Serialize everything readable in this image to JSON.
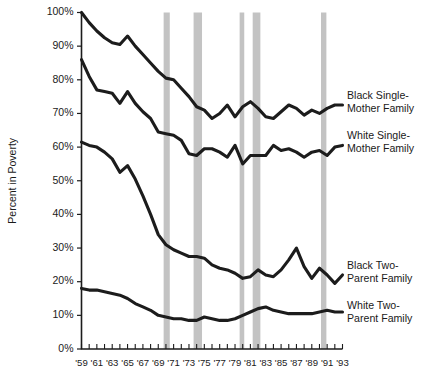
{
  "chart_data": {
    "type": "line",
    "title": "",
    "xlabel": "",
    "ylabel": "Percent in Poverty",
    "ylim": [
      0,
      100
    ],
    "xlim": [
      1959,
      1993
    ],
    "grid": false,
    "legend_position": "right-inline",
    "y_ticks": [
      "0%",
      "10%",
      "20%",
      "30%",
      "40%",
      "50%",
      "60%",
      "70%",
      "80%",
      "90%",
      "100%"
    ],
    "y_tick_values": [
      0,
      10,
      20,
      30,
      40,
      50,
      60,
      70,
      80,
      90,
      100
    ],
    "x_ticks": [
      "'59",
      "'61",
      "'63",
      "'65",
      "'67",
      "'69",
      "'71",
      "'73",
      "'75",
      "'77",
      "'79",
      "'81",
      "'83",
      "'85",
      "'87",
      "'89",
      "'91",
      "'93"
    ],
    "x_tick_values": [
      1959,
      1961,
      1963,
      1965,
      1967,
      1969,
      1971,
      1973,
      1975,
      1977,
      1979,
      1981,
      1983,
      1985,
      1987,
      1989,
      1991,
      1993
    ],
    "x": [
      1959,
      1960,
      1961,
      1962,
      1963,
      1964,
      1965,
      1966,
      1967,
      1968,
      1969,
      1970,
      1971,
      1972,
      1973,
      1974,
      1975,
      1976,
      1977,
      1978,
      1979,
      1980,
      1981,
      1982,
      1983,
      1984,
      1985,
      1986,
      1987,
      1988,
      1989,
      1990,
      1991,
      1992,
      1993
    ],
    "series": [
      {
        "name": "Black Single-Mother Family",
        "color": "#1c1c1c",
        "values": [
          100.0,
          97.0,
          94.5,
          92.5,
          91.0,
          90.5,
          93.0,
          90.0,
          87.5,
          85.0,
          82.5,
          80.5,
          80.0,
          77.5,
          75.0,
          72.0,
          71.0,
          68.5,
          70.0,
          72.5,
          69.0,
          72.0,
          73.5,
          71.5,
          69.0,
          68.5,
          70.5,
          72.5,
          71.5,
          69.5,
          71.0,
          70.0,
          71.5,
          72.5,
          72.5
        ]
      },
      {
        "name": "White Single-Mother Family",
        "color": "#1c1c1c",
        "values": [
          86.0,
          81.0,
          77.0,
          76.5,
          76.0,
          73.0,
          76.5,
          73.0,
          70.5,
          68.5,
          64.5,
          64.0,
          63.5,
          62.0,
          58.0,
          57.5,
          59.5,
          59.5,
          58.5,
          57.0,
          60.5,
          55.0,
          57.5,
          57.5,
          57.5,
          60.5,
          59.0,
          59.5,
          58.5,
          57.0,
          58.5,
          59.0,
          57.5,
          60.0,
          60.5
        ]
      },
      {
        "name": "Black Two-Parent Family",
        "color": "#1c1c1c",
        "values": [
          61.5,
          60.5,
          60.0,
          58.5,
          56.5,
          52.5,
          54.5,
          50.5,
          45.5,
          40.0,
          34.0,
          31.0,
          29.5,
          28.5,
          27.5,
          27.5,
          27.0,
          25.0,
          24.0,
          23.5,
          22.5,
          21.0,
          21.5,
          23.5,
          22.0,
          21.5,
          23.5,
          26.5,
          30.0,
          24.5,
          21.0,
          24.0,
          22.0,
          19.5,
          22.0
        ]
      },
      {
        "name": "White Two-Parent Family",
        "color": "#1c1c1c",
        "values": [
          18.0,
          17.5,
          17.5,
          17.0,
          16.5,
          16.0,
          15.0,
          13.5,
          12.5,
          11.5,
          10.0,
          9.5,
          9.0,
          9.0,
          8.5,
          8.5,
          9.5,
          9.0,
          8.5,
          8.5,
          9.0,
          10.0,
          11.0,
          12.0,
          12.5,
          11.5,
          11.0,
          10.5,
          10.5,
          10.5,
          10.5,
          11.0,
          11.5,
          11.0,
          11.0
        ]
      }
    ],
    "recession_bands": [
      {
        "start": 1969.7,
        "end": 1970.5
      },
      {
        "start": 1973.6,
        "end": 1974.7
      },
      {
        "start": 1979.6,
        "end": 1980.2
      },
      {
        "start": 1981.3,
        "end": 1982.3
      },
      {
        "start": 1990.2,
        "end": 1990.9
      }
    ],
    "recession_color": "#c3c3c3"
  },
  "legend": {
    "items": [
      {
        "line1": "Black Single-",
        "line2": "Mother Family"
      },
      {
        "line1": "White Single-",
        "line2": "Mother Family"
      },
      {
        "line1": "Black Two-",
        "line2": "Parent Family"
      },
      {
        "line1": "White Two-",
        "line2": "Parent Family"
      }
    ]
  }
}
